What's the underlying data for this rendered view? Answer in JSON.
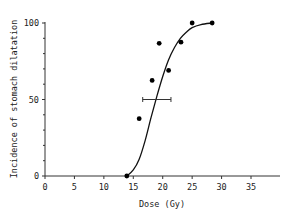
{
  "chart_data": {
    "type": "scatter",
    "title": "",
    "xlabel": "Dose (Gy)",
    "ylabel": "Incidence of stomach dilatation",
    "xlim": [
      0,
      39
    ],
    "ylim": [
      0,
      100
    ],
    "x_ticks": [
      0,
      5,
      10,
      15,
      20,
      25,
      30,
      35
    ],
    "y_ticks": [
      0,
      50,
      100
    ],
    "y_minor_ticks": [
      10,
      20,
      30,
      40,
      60,
      70,
      80,
      90
    ],
    "grid": false,
    "legend": null,
    "series": [
      {
        "name": "Observed incidence",
        "type": "scatter",
        "points": [
          {
            "x": 13.9,
            "y": 0
          },
          {
            "x": 16.0,
            "y": 37.5
          },
          {
            "x": 18.2,
            "y": 62.5
          },
          {
            "x": 19.4,
            "y": 86.7
          },
          {
            "x": 21.0,
            "y": 69
          },
          {
            "x": 23.1,
            "y": 87.5
          },
          {
            "x": 25.0,
            "y": 100
          },
          {
            "x": 28.4,
            "y": 100
          }
        ]
      },
      {
        "name": "Fitted dose-response curve",
        "type": "line",
        "points": [
          {
            "x": 13.9,
            "y": 0
          },
          {
            "x": 15.0,
            "y": 4
          },
          {
            "x": 16.0,
            "y": 11
          },
          {
            "x": 17.0,
            "y": 23
          },
          {
            "x": 18.0,
            "y": 38
          },
          {
            "x": 19.0,
            "y": 52
          },
          {
            "x": 20.0,
            "y": 65
          },
          {
            "x": 21.0,
            "y": 76
          },
          {
            "x": 22.0,
            "y": 84
          },
          {
            "x": 23.0,
            "y": 90
          },
          {
            "x": 24.0,
            "y": 94
          },
          {
            "x": 25.0,
            "y": 97
          },
          {
            "x": 26.5,
            "y": 99
          },
          {
            "x": 28.4,
            "y": 100
          }
        ]
      }
    ],
    "annotations": [
      {
        "type": "horizontal_error_bar",
        "label": "ED50 confidence interval",
        "y": 50,
        "x_center": 19.0,
        "x_low": 16.6,
        "x_high": 21.4
      }
    ]
  }
}
